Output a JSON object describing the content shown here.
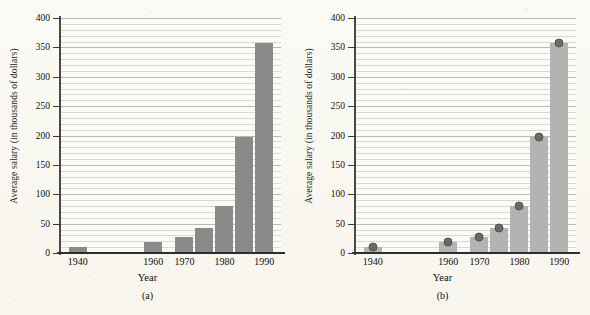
{
  "figure": {
    "background_color": "#fdfcf7",
    "panel_count": 2
  },
  "axis": {
    "ylabel": "Average salary (in thousands of dollars)",
    "xlabel": "Year",
    "y_ticks": [
      0,
      50,
      100,
      150,
      200,
      250,
      300,
      350,
      400
    ],
    "y_min": 0,
    "y_max": 400,
    "minor_gridline_step": 10,
    "x_tick_labels": [
      "1940",
      "1960",
      "1970",
      "1980",
      "1990"
    ]
  },
  "panels": [
    {
      "caption": "(a)",
      "bar_color": "#8a8a8a",
      "has_markers": false
    },
    {
      "caption": "(b)",
      "bar_color": "#b3b3b3",
      "marker_color": "#6a6a6a",
      "has_markers": true
    }
  ],
  "chart_data": {
    "type": "bar",
    "title": "",
    "xlabel": "Year",
    "ylabel": "Average salary (in thousands of dollars)",
    "ylim": [
      0,
      400
    ],
    "grid": true,
    "legend": "none",
    "x": [
      1940,
      1960,
      1970,
      1975,
      1980,
      1985,
      1990
    ],
    "categories": [
      "1940",
      "1960",
      "1970",
      "1975",
      "1980",
      "1985",
      "1990"
    ],
    "tick_labels_shown": [
      "1940",
      "1960",
      "1970",
      "1980",
      "1990"
    ],
    "series": [
      {
        "name": "Average salary (thousands of dollars)",
        "values": [
          10,
          18,
          27,
          43,
          80,
          198,
          357
        ]
      }
    ],
    "panels": [
      {
        "caption": "(a)",
        "type": "bar",
        "values": [
          10,
          18,
          27,
          43,
          80,
          198,
          357
        ],
        "bar_color": "#8a8a8a",
        "markers": false
      },
      {
        "caption": "(b)",
        "type": "bar",
        "values": [
          10,
          18,
          27,
          43,
          80,
          198,
          357
        ],
        "bar_color": "#b3b3b3",
        "markers": true,
        "marker_color": "#6a6a6a",
        "marker_values": [
          10,
          18,
          27,
          43,
          80,
          198,
          357
        ]
      }
    ]
  }
}
